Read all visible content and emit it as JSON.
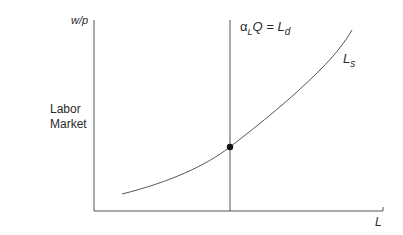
{
  "diagram": {
    "side_label_line1": "Labor",
    "side_label_line2": "Market",
    "y_axis_label": "w/p",
    "x_axis_label": "L",
    "demand_label_prefix": "α",
    "demand_label_sub": "L",
    "demand_label_mid": "Q = L",
    "demand_label_sub2": "d",
    "supply_label": "L",
    "supply_label_sub": "s",
    "colors": {
      "line": "#555555",
      "dot": "#111111",
      "text": "#2a2a2a"
    }
  }
}
